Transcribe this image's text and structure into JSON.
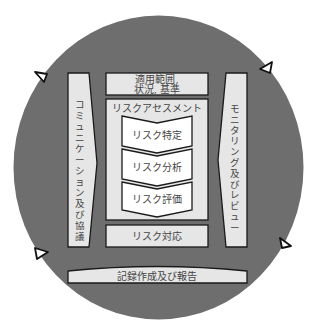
{
  "diagram": {
    "title": "",
    "colors": {
      "background": "#ffffff",
      "circle": "#6e6e6e",
      "box_fill": "#e6e6e6",
      "chevron_fill": "#ffffff",
      "stroke": "#1a1a1a",
      "text": "#444444"
    },
    "left_bar": {
      "label": "コミュニケーション及び協議",
      "chars": [
        "コ",
        "ミ",
        "ュ",
        "ニ",
        "ケ",
        "ー",
        "シ",
        "ョ",
        "ン",
        "及",
        "び",
        "協",
        "議"
      ]
    },
    "right_bar": {
      "label": "モニタリング及びレビュー",
      "chars": [
        "モ",
        "ニ",
        "タ",
        "リ",
        "ン",
        "グ",
        "及",
        "び",
        "レ",
        "ビ",
        "ュ",
        "ー"
      ]
    },
    "scope_box": {
      "line1": "適用範囲,",
      "line2": "状況, 基準"
    },
    "assessment_box": {
      "title": "リスクアセスメント",
      "steps": [
        {
          "label": "リスク特定"
        },
        {
          "label": "リスク分析"
        },
        {
          "label": "リスク評価"
        }
      ]
    },
    "treatment_box": {
      "label": "リスク対応"
    },
    "bottom_bar": {
      "label": "記録作成及び報告"
    },
    "cycle_markers": [
      {
        "name": "arrow-marker-top-left",
        "direction": "pointing-left-down"
      },
      {
        "name": "arrow-marker-top-right",
        "direction": "pointing-left-up"
      },
      {
        "name": "arrow-marker-bottom-left",
        "direction": "pointing-right-down"
      },
      {
        "name": "arrow-marker-bottom-right",
        "direction": "pointing-right-up"
      }
    ]
  }
}
